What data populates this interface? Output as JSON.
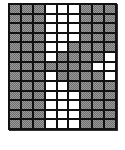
{
  "grid": {
    "columns": 9,
    "rows": 13,
    "colors": {
      "filled": "#9a9a9a",
      "empty": "#ffffff",
      "border": "#111111"
    },
    "legend": "G = gray dithered cell, W = white cell",
    "cells": [
      "GGGWWWGGG",
      "GGGWWWGGG",
      "GGGWWWGGG",
      "GGGWWWGGG",
      "GGGWWGGGG",
      "GGGWGGGGW",
      "GGGGGGGWW",
      "GGGWGGGGW",
      "GGGWWGGGG",
      "GGGWWWGGG",
      "GGGWWWGGG",
      "GGGWWWGGG",
      "GGGWWWGGG"
    ]
  }
}
